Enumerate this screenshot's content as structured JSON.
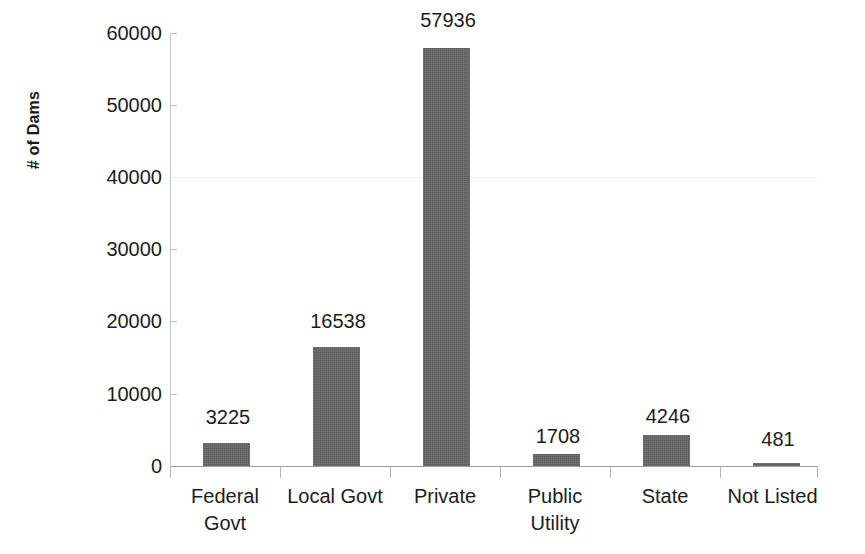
{
  "chart_data": {
    "type": "bar",
    "title": "",
    "subtitle": "",
    "xlabel": "",
    "ylabel": "# of Dams",
    "categories": [
      "Federal Govt",
      "Local Govt",
      "Private",
      "Public Utility",
      "State",
      "Not Listed"
    ],
    "values": [
      3225,
      16538,
      57936,
      1708,
      4246,
      481
    ],
    "data_labels": [
      "3225",
      "16538",
      "57936",
      "1708",
      "4246",
      "481"
    ],
    "ylim": [
      0,
      60000
    ],
    "y_ticks": [
      0,
      10000,
      20000,
      30000,
      40000,
      50000,
      60000
    ],
    "y_tick_labels": [
      "0",
      "10000",
      "20000",
      "30000",
      "40000",
      "50000",
      "60000"
    ],
    "grid": false,
    "legend": null,
    "series": [
      {
        "name": "# of Dams",
        "color": "#636363",
        "values": [
          3225,
          16538,
          57936,
          1708,
          4246,
          481
        ]
      }
    ]
  },
  "axes": {
    "y_title": "# of Dams",
    "y_tick_labels": [
      "60000",
      "50000",
      "40000",
      "30000",
      "20000",
      "10000",
      "0"
    ],
    "x_tick_labels": [
      {
        "line1": "Federal",
        "line2": "Govt"
      },
      {
        "line1": "Local Govt",
        "line2": ""
      },
      {
        "line1": "Private",
        "line2": ""
      },
      {
        "line1": "Public",
        "line2": "Utility"
      },
      {
        "line1": "State",
        "line2": ""
      },
      {
        "line1": "Not Listed",
        "line2": ""
      }
    ]
  },
  "colors": {
    "bar_fill": "#636363",
    "axis_line": "#9a9a9a",
    "tick_line": "#bfbfbf",
    "text": "#1c1c1c",
    "background": "#ffffff"
  }
}
